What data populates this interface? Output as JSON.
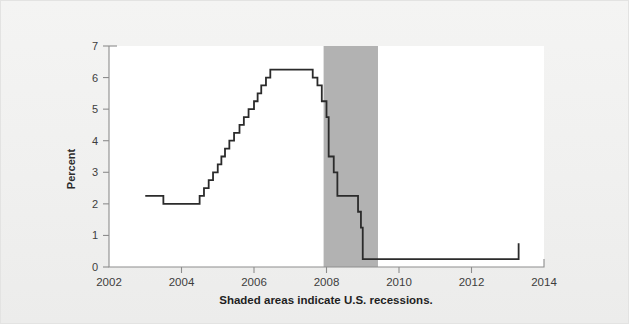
{
  "figure": {
    "background_color": "#f2f2f1",
    "plot_background_color": "#ffffff",
    "caption": "Shaded areas indicate U.S. recessions."
  },
  "chart_data": {
    "type": "line",
    "line_style": "step-post",
    "title": "",
    "subtitle": "",
    "xlabel": "",
    "ylabel": "Percent",
    "xlim": [
      2002,
      2014
    ],
    "ylim": [
      0,
      7
    ],
    "xticks": [
      2002,
      2004,
      2006,
      2008,
      2010,
      2012,
      2014
    ],
    "xtick_labels": [
      "2002",
      "2004",
      "2006",
      "2008",
      "2010",
      "2012",
      "2014"
    ],
    "yticks": [
      0,
      1,
      2,
      3,
      4,
      5,
      6,
      7
    ],
    "ytick_labels": [
      "0",
      "1",
      "2",
      "3",
      "4",
      "5",
      "6",
      "7"
    ],
    "grid": false,
    "legend": null,
    "line_color": "#2b2b2b",
    "line_width": 1.8,
    "series": [
      {
        "name": "Percent",
        "x": [
          2003.0,
          2003.45,
          2003.5,
          2004.4,
          2004.5,
          2004.62,
          2004.75,
          2004.87,
          2005.0,
          2005.1,
          2005.2,
          2005.32,
          2005.45,
          2005.6,
          2005.72,
          2005.85,
          2006.0,
          2006.1,
          2006.2,
          2006.33,
          2006.45,
          2006.55,
          2007.62,
          2007.75,
          2007.87,
          2008.0,
          2008.06,
          2008.2,
          2008.3,
          2008.82,
          2008.87,
          2008.95,
          2009.0,
          2010.08,
          2013.3
        ],
        "y": [
          2.25,
          2.25,
          2.0,
          2.0,
          2.25,
          2.5,
          2.75,
          3.0,
          3.25,
          3.5,
          3.75,
          4.0,
          4.25,
          4.5,
          4.75,
          5.0,
          5.25,
          5.5,
          5.75,
          6.0,
          6.25,
          6.25,
          6.0,
          5.75,
          5.25,
          4.75,
          3.5,
          3.0,
          2.25,
          2.25,
          1.75,
          1.25,
          0.25,
          0.25,
          0.75
        ]
      }
    ],
    "shaded_regions": [
      {
        "label": "U.S. recession",
        "x_start": 2007.92,
        "x_end": 2009.42,
        "color": "#b2b2b2"
      }
    ],
    "annotations": [
      {
        "text": "Shaded areas indicate U.S. recessions.",
        "position": "below-axis"
      }
    ]
  }
}
